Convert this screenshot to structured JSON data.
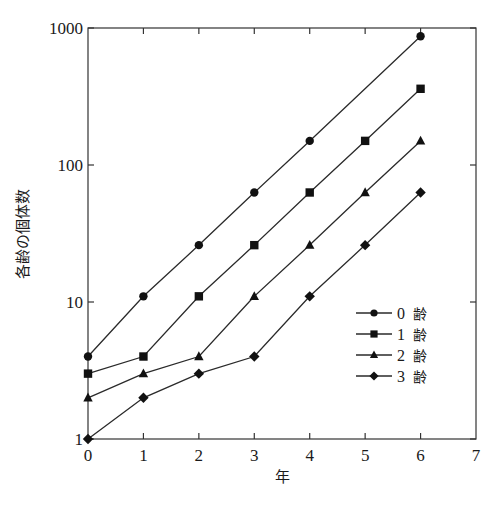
{
  "chart_data": {
    "type": "line",
    "title": "",
    "xlabel": "年",
    "ylabel": "各齢の個体数",
    "yscale": "log",
    "xlim": [
      0,
      7
    ],
    "ylim": [
      1,
      1000
    ],
    "x_ticks": [
      "0",
      "1",
      "2",
      "3",
      "4",
      "5",
      "6",
      "7"
    ],
    "y_ticks": [
      "1",
      "10",
      "100",
      "1000"
    ],
    "grid": false,
    "legend_position": "center-right",
    "series": [
      {
        "name": "0 齢",
        "marker": "circle",
        "points": [
          [
            0,
            4
          ],
          [
            1,
            11
          ],
          [
            2,
            26
          ],
          [
            3,
            63
          ],
          [
            4,
            150
          ],
          [
            6,
            870
          ]
        ]
      },
      {
        "name": "1 齢",
        "marker": "square",
        "points": [
          [
            0,
            3
          ],
          [
            1,
            4
          ],
          [
            2,
            11
          ],
          [
            3,
            26
          ],
          [
            4,
            63
          ],
          [
            5,
            150
          ],
          [
            6,
            360
          ]
        ]
      },
      {
        "name": "2 齢",
        "marker": "triangle",
        "points": [
          [
            0,
            2
          ],
          [
            1,
            3
          ],
          [
            2,
            4
          ],
          [
            3,
            11
          ],
          [
            4,
            26
          ],
          [
            5,
            63
          ],
          [
            6,
            150
          ]
        ]
      },
      {
        "name": "3 齢",
        "marker": "diamond",
        "points": [
          [
            0,
            1
          ],
          [
            1,
            2
          ],
          [
            2,
            3
          ],
          [
            3,
            4
          ],
          [
            4,
            11
          ],
          [
            5,
            26
          ],
          [
            6,
            63
          ]
        ]
      }
    ]
  },
  "legend": {
    "items": [
      {
        "num": "0",
        "kanji": "齢",
        "marker": "circle"
      },
      {
        "num": "1",
        "kanji": "齢",
        "marker": "square"
      },
      {
        "num": "2",
        "kanji": "齢",
        "marker": "triangle"
      },
      {
        "num": "3",
        "kanji": "齢",
        "marker": "diamond"
      }
    ]
  },
  "axes": {
    "x_title": "年",
    "y_title": "各齢の個体数"
  }
}
